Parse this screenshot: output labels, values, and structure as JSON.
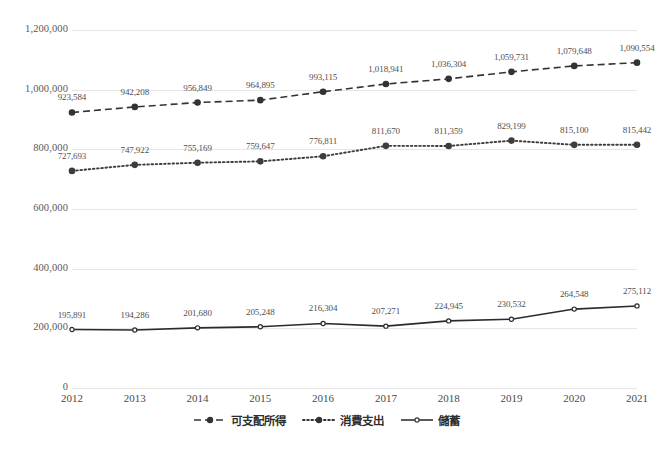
{
  "chart_data": {
    "type": "line",
    "title": "",
    "xlabel": "",
    "ylabel": "",
    "ylim": [
      0,
      1200000
    ],
    "grid": true,
    "legend_position": "bottom",
    "categories": [
      "2012",
      "2013",
      "2014",
      "2015",
      "2016",
      "2017",
      "2018",
      "2019",
      "2020",
      "2021"
    ],
    "y_ticks": [
      "0",
      "200,000",
      "400,000",
      "600,000",
      "800,000",
      "1,000,000",
      "1,200,000"
    ],
    "y_tick_values": [
      0,
      200000,
      400000,
      600000,
      800000,
      1000000,
      1200000
    ],
    "series": [
      {
        "name": "可支配所得",
        "style": "dashed",
        "color": "#333333",
        "values": [
          923584,
          942208,
          956849,
          964895,
          993115,
          1018941,
          1036304,
          1059731,
          1079648,
          1090554
        ],
        "labels": [
          "923,584",
          "942,208",
          "956,849",
          "964,895",
          "993,115",
          "1,018,941",
          "1,036,304",
          "1,059,731",
          "1,079,648",
          "1,090,554"
        ]
      },
      {
        "name": "消費支出",
        "style": "dotted",
        "color": "#3d3d3d",
        "values": [
          727693,
          747922,
          755169,
          759647,
          776811,
          811670,
          811359,
          829199,
          815100,
          815442
        ],
        "labels": [
          "727,693",
          "747,922",
          "755,169",
          "759,647",
          "776,811",
          "811,670",
          "811,359",
          "829,199",
          "815,100",
          "815,442"
        ]
      },
      {
        "name": "儲蓄",
        "style": "solid",
        "color": "#2b2b2b",
        "values": [
          195891,
          194286,
          201680,
          205248,
          216304,
          207271,
          224945,
          230532,
          264548,
          275112
        ],
        "labels": [
          "195,891",
          "194,286",
          "201,680",
          "205,248",
          "216,304",
          "207,271",
          "224,945",
          "230,532",
          "264,548",
          "275,112"
        ]
      }
    ]
  },
  "legend": {
    "items": [
      {
        "label": "可支配所得",
        "style": "dashed"
      },
      {
        "label": "消費支出",
        "style": "dotted"
      },
      {
        "label": "儲蓄",
        "style": "solid"
      }
    ]
  },
  "colors": {
    "grid": "#e6e6e6",
    "axis_text": "#595959",
    "series_ink": "#333333",
    "background": "#ffffff"
  }
}
